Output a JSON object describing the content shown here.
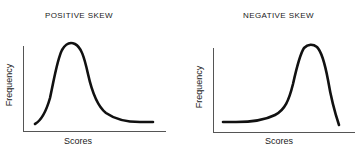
{
  "figures": [
    {
      "title": "POSITIVE SKEW",
      "xlabel": "Scores",
      "ylabel": "Frequency"
    },
    {
      "title": "NEGATIVE SKEW",
      "xlabel": "Scores",
      "ylabel": "Frequency"
    }
  ],
  "colors": {
    "curve": "#111111",
    "axis": "#555555",
    "text": "#1a1a1a",
    "background": "#ffffff"
  }
}
